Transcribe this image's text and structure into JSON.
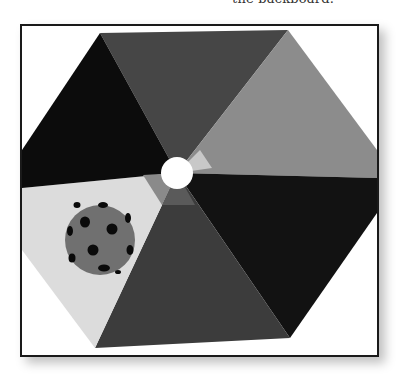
{
  "caption": {
    "text": "the backboard."
  },
  "figure": {
    "sectors": [
      {
        "name": "top",
        "color": "#464646"
      },
      {
        "name": "upper-right",
        "color": "#8c8c8c"
      },
      {
        "name": "lower-right",
        "color": "#121212"
      },
      {
        "name": "bottom",
        "color": "#3c3c3c"
      },
      {
        "name": "lower-left",
        "color": "#dcdcdc"
      },
      {
        "name": "upper-left",
        "color": "#0c0c0c"
      }
    ],
    "center_hole_color": "#ffffff",
    "ball": {
      "color": "#707070",
      "dot_color": "#0a0a0a",
      "dot_count": 11
    }
  }
}
